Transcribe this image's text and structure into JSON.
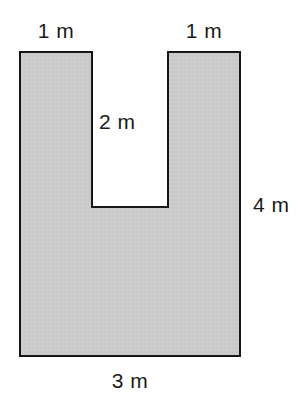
{
  "figure": {
    "kind": "u-shaped-polygon",
    "colors": {
      "fill": "#cbcbcb",
      "stroke": "#161616",
      "background": "#ffffff",
      "notch_fill": "#ffffff",
      "label_text": "#1a1a1a"
    },
    "geometry": {
      "outer_left": 20,
      "outer_right": 240,
      "outer_top": 52,
      "outer_bottom": 356,
      "notch_left": 92,
      "notch_right": 168,
      "notch_bottom": 207,
      "stroke_width": 2,
      "path": "M20,52 L92,52 L92,207 L168,207 L168,52 L240,52 L240,356 L20,356 Z"
    }
  },
  "labels": {
    "top_left": "1 m",
    "top_right": "1 m",
    "notch_depth": "2 m",
    "right_height": "4 m",
    "bottom_width": "3 m"
  },
  "chart_data": {
    "type": "diagram",
    "title": "",
    "shape": "U-shape (rectangle with rectangular notch)",
    "unit": "m",
    "dimensions": [
      {
        "name": "top-left arm width",
        "label": "1 m",
        "value": 1,
        "unit": "m",
        "position": "top-left"
      },
      {
        "name": "top-right arm width",
        "label": "1 m",
        "value": 1,
        "unit": "m",
        "position": "top-right"
      },
      {
        "name": "notch depth",
        "label": "2 m",
        "value": 2,
        "unit": "m",
        "position": "inside-notch"
      },
      {
        "name": "overall height",
        "label": "4 m",
        "value": 4,
        "unit": "m",
        "position": "right-side"
      },
      {
        "name": "overall width",
        "label": "3 m",
        "value": 3,
        "unit": "m",
        "position": "bottom"
      }
    ]
  }
}
